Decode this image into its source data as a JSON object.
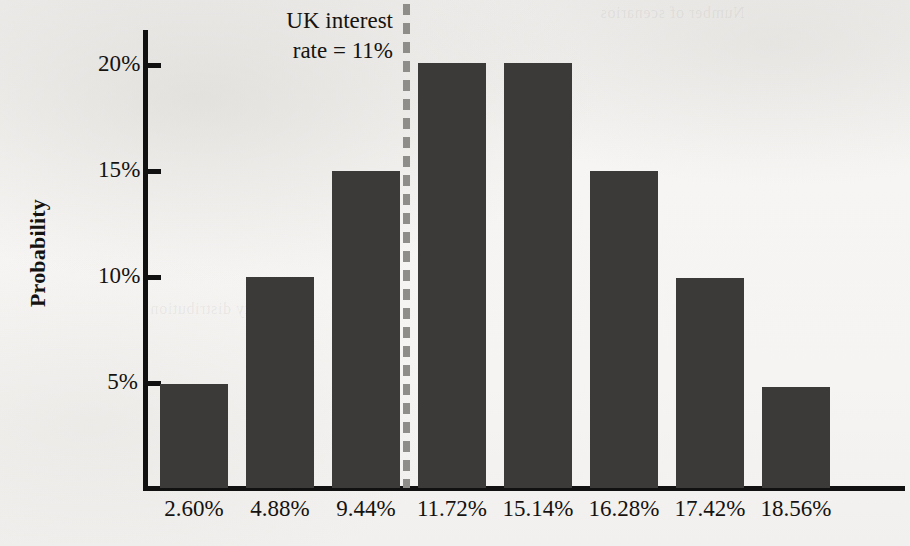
{
  "chart_data": {
    "type": "bar",
    "title": "",
    "xlabel": "",
    "ylabel": "Probability",
    "categories": [
      "2.60%",
      "4.88%",
      "9.44%",
      "11.72%",
      "15.14%",
      "16.28%",
      "17.42%",
      "18.56%"
    ],
    "values": [
      4.9,
      9.9,
      14.9,
      20.0,
      20.0,
      14.9,
      9.9,
      4.7
    ],
    "ylim": [
      0,
      21.5
    ],
    "yticks": [
      5,
      10,
      15,
      20
    ],
    "ytick_labels": [
      "5%",
      "10%",
      "15%",
      "20%"
    ],
    "grid": false,
    "legend": null,
    "bar_color": "#3b3a38",
    "background_color": "#f4f3f1",
    "annotations": [
      {
        "name": "uk-interest-rate-threshold",
        "line_1": "UK interest",
        "line_2": "rate = 11%",
        "value": 11,
        "line_style": "dashed",
        "line_color": "#8e8d8a"
      }
    ]
  },
  "axes": {
    "y_label": "Probability",
    "y_ticks": [
      {
        "label": "5%",
        "top": 375
      },
      {
        "label": "10%",
        "top": 269
      },
      {
        "label": "15%",
        "top": 163
      },
      {
        "label": "20%",
        "top": 57
      }
    ],
    "y_tick_marks": [
      381,
      275,
      169,
      63
    ]
  },
  "bars": [
    {
      "label": "2.60%",
      "value": 4.9,
      "left": 160,
      "width": 68,
      "top": 384,
      "height": 104
    },
    {
      "label": "4.88%",
      "value": 9.9,
      "left": 246,
      "width": 68,
      "top": 277,
      "height": 211
    },
    {
      "label": "9.44%",
      "value": 14.9,
      "left": 332,
      "width": 68,
      "top": 171,
      "height": 317
    },
    {
      "label": "11.72%",
      "value": 20.0,
      "left": 418,
      "width": 68,
      "top": 63,
      "height": 425
    },
    {
      "label": "15.14%",
      "value": 20.0,
      "left": 504,
      "width": 68,
      "top": 63,
      "height": 425
    },
    {
      "label": "16.28%",
      "value": 14.9,
      "left": 590,
      "width": 68,
      "top": 171,
      "height": 317
    },
    {
      "label": "17.42%",
      "value": 9.9,
      "left": 676,
      "width": 68,
      "top": 278,
      "height": 210
    },
    {
      "label": "18.56%",
      "value": 4.7,
      "left": 762,
      "width": 68,
      "top": 387,
      "height": 101
    }
  ],
  "annotation": {
    "line_1": "UK interest",
    "line_2": "rate = 11%"
  },
  "ghost_text": {
    "top_right": "Number of scenarios",
    "mid_left": "probability distribution"
  }
}
